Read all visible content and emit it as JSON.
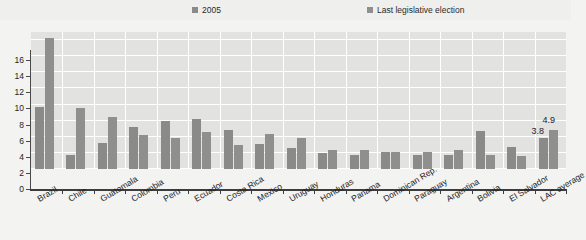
{
  "legend": {
    "entries": [
      {
        "label": "2005",
        "color": "#8a8a88"
      },
      {
        "label": "Last legislative election",
        "color": "#8f8f8d"
      }
    ]
  },
  "axis": {
    "y_ticks": [
      "0",
      "2",
      "4",
      "6",
      "8",
      "10",
      "12",
      "14",
      "16"
    ]
  },
  "chart_data": {
    "type": "bar",
    "title": "",
    "xlabel": "",
    "ylabel": "",
    "ylim": [
      0,
      17
    ],
    "grid": true,
    "legend_position": "top",
    "categories": [
      "Brazil",
      "Chile",
      "Guatemala",
      "Colombia",
      "Peru",
      "Ecuador",
      "Costa Rica",
      "Mexico",
      "Uruguay",
      "Honduras",
      "Panama",
      "Dominican Rep.",
      "Paraguay",
      "Argentina",
      "Bolivia",
      "El Salvador",
      "LAC average"
    ],
    "series": [
      {
        "name": "2005",
        "color": "#8a8a88",
        "values": [
          7.7,
          1.7,
          3.2,
          5.2,
          6.0,
          6.2,
          4.8,
          3.1,
          2.6,
          2.0,
          1.7,
          2.1,
          1.7,
          1.8,
          4.7,
          2.7,
          3.8
        ]
      },
      {
        "name": "Last legislative election",
        "color": "#8f8f8d",
        "values": [
          16.3,
          7.6,
          6.5,
          4.2,
          3.8,
          4.6,
          3.0,
          4.3,
          3.9,
          2.3,
          2.4,
          2.1,
          2.1,
          2.3,
          1.8,
          1.6,
          4.9
        ]
      }
    ],
    "data_labels": [
      {
        "category": "LAC average",
        "series": "2005",
        "text": "3.8"
      },
      {
        "category": "LAC average",
        "series": "Last legislative election",
        "text": "4.9"
      }
    ]
  }
}
